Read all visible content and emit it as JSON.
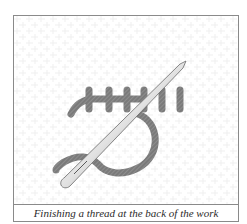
{
  "figure": {
    "caption": "Finishing a thread at the back of the work",
    "illustration": {
      "subject": "needle-and-thread",
      "colors": {
        "thread": "#7a7a7a",
        "thread_hatch": "#9c9c9c",
        "needle_light": "#f4f4f4",
        "needle_dark": "#6a6a6a",
        "fabric_grid": "#ededed",
        "border": "#8a8a8a"
      }
    }
  }
}
